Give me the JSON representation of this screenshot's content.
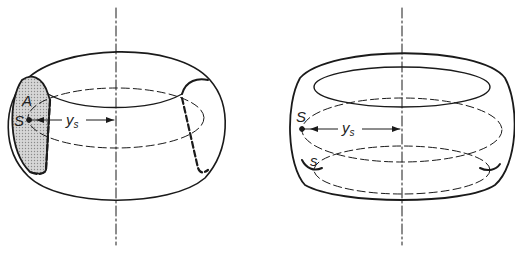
{
  "figure": {
    "left": {
      "title": "torus-volume",
      "labels": {
        "area": "A",
        "centroid": "S",
        "distance": "y",
        "distance_sub": "s"
      }
    },
    "right": {
      "title": "torus-surface",
      "labels": {
        "centroid": "S",
        "distance": "y",
        "distance_sub": "s",
        "arc": "s"
      }
    }
  },
  "colors": {
    "stroke": "#1a1a1a",
    "hatch": "#b8b8b8",
    "background": "#ffffff"
  }
}
